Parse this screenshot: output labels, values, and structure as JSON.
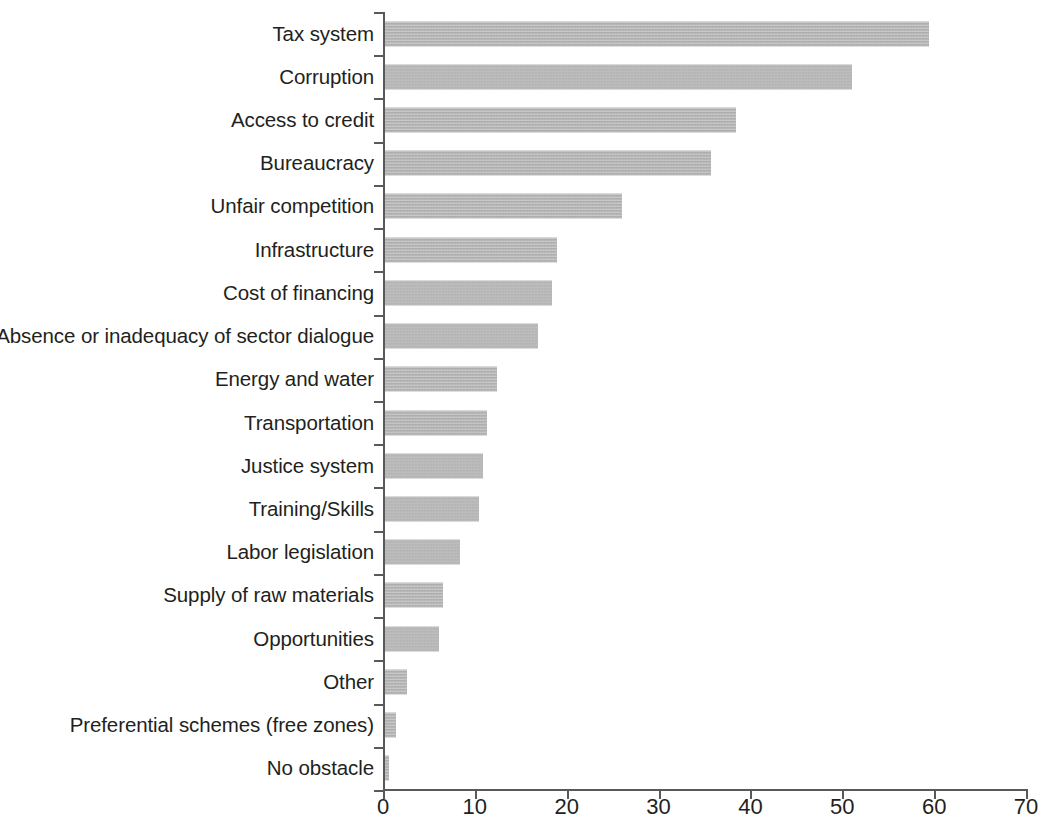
{
  "chart_data": {
    "type": "bar",
    "orientation": "horizontal",
    "title": "",
    "subtitle": "",
    "xlabel": "",
    "ylabel": "",
    "xlim": [
      0,
      70
    ],
    "xticks": [
      0,
      10,
      20,
      30,
      40,
      50,
      60,
      70
    ],
    "xtick_labels": [
      "0",
      "10",
      "20",
      "30",
      "40",
      "50",
      "60",
      "70"
    ],
    "grid": false,
    "legend": null,
    "bar_color": "#b6b6b6",
    "axis_color": "#58595b",
    "text_color": "#231f20",
    "categories": [
      "Tax system",
      "Corruption",
      "Access to credit",
      "Bureaucracy",
      "Unfair competition",
      "Infrastructure",
      "Cost of financing",
      "Absence or inadequacy of sector dialogue",
      "Energy and water",
      "Transportation",
      "Justice system",
      "Training/Skills",
      "Labor legislation",
      "Supply of raw materials",
      "Opportunities",
      "Other",
      "Preferential schemes (free zones)",
      "No obstacle"
    ],
    "values": [
      59.4,
      51.1,
      38.4,
      35.7,
      26.0,
      18.9,
      18.4,
      16.9,
      12.4,
      11.3,
      10.9,
      10.5,
      8.4,
      6.5,
      6.1,
      2.6,
      1.4,
      0.6
    ]
  }
}
